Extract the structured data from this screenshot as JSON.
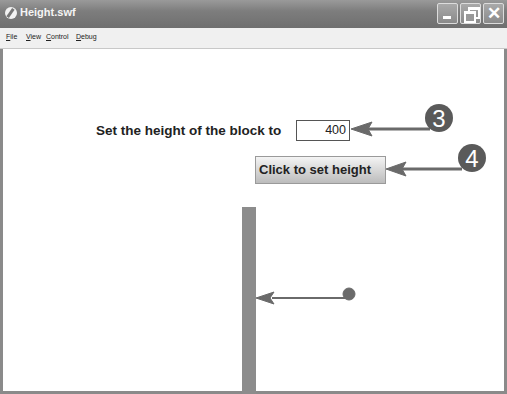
{
  "window": {
    "title": "Height.swf",
    "controls": {
      "minimize": "minimize",
      "maximize": "restore",
      "close": "✕"
    }
  },
  "menubar": {
    "items": [
      "File",
      "View",
      "Control",
      "Debug"
    ]
  },
  "form": {
    "label": "Set the height of the block to",
    "height_value": "400",
    "button_label": "Click to set height"
  },
  "callouts": [
    {
      "number": "3",
      "target": "height-input"
    },
    {
      "number": "4",
      "target": "set-button"
    }
  ],
  "annotation": {
    "target": "block"
  },
  "colors": {
    "titlebar": "#7d7d7d",
    "block": "#8c8c8c",
    "callout": "#5a5a5a",
    "arrow": "#6a6a6a"
  }
}
